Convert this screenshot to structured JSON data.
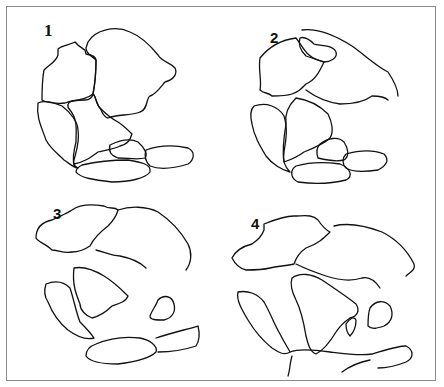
{
  "diagram": {
    "type": "continental-drift-sequence",
    "frame_color": "#8a8a8a",
    "stroke_color": "#111111",
    "panels": [
      {
        "label": "1",
        "label_pos": [
          44,
          29
        ],
        "paths": [
          "M88,42 C95,30 115,25 130,32 C140,36 150,45 158,55 C162,62 170,62 175,68 C178,74 173,80 165,82 C160,88 155,95 150,96 C146,98 148,110 140,112 C130,116 118,114 108,118 C104,118 102,112 100,108 C96,104 96,96 93,94 C95,84 96,74 96,60 C92,56 86,54 86,48 Z",
          "M58,49 C62,45 70,45 75,42 C78,46 82,48 85,50 L86,54 C92,55 96,57 96,60 C96,74 95,84 93,94 C92,98 90,100 85,100 C78,100 70,101 65,103 C55,104 45,102 42,100 C42,90 42,80 44,70 C50,64 56,62 58,55 Z",
          "M93,94 C96,96 96,104 100,108 C106,114 110,118 118,122 C124,126 128,130 132,134 C130,140 128,144 120,146 C112,150 104,150 98,152 C90,158 84,162 74,164 C72,158 74,150 76,142 C76,130 78,120 70,110 C66,106 68,102 72,101 C80,100 88,98 93,94 Z",
          "M38,103 C45,100 55,103 62,106 C70,112 78,122 78,130 C80,142 76,152 74,160 C72,164 74,166 78,168 C74,168 70,164 64,160 C58,154 50,148 46,140 C42,128 36,118 38,103 Z",
          "M110,145 C120,140 130,138 138,142 C145,148 148,155 145,158 C138,160 128,158 118,158 C112,156 108,152 110,145 Z",
          "M146,150 C160,145 175,145 188,148 C196,152 194,160 188,164 C175,168 160,170 150,166 C146,162 144,156 146,150 Z",
          "M82,165 C95,162 110,160 128,160 C140,162 152,164 150,172 C146,178 130,182 112,182 C95,180 80,178 76,172 C76,168 80,166 82,165 Z"
        ]
      },
      {
        "label": "2",
        "label_pos": [
          270,
          36
        ],
        "paths": [
          "M302,30 C318,28 336,36 352,46 C366,56 376,66 388,72 C392,78 398,88 398,96",
          "M300,38 C305,36 310,40 314,44 C318,46 332,44 336,52 C338,58 330,62 324,62 C318,60 312,58 306,56 C300,50 298,44 300,38 Z",
          "M260,58 C268,48 280,40 296,38 C304,48 306,58 324,62 C320,70 316,80 306,84 C300,90 298,92 292,94 C286,96 280,96 272,96 C268,92 264,94 260,90 C262,80 258,70 260,58 Z",
          "M306,90 C314,96 326,102 340,104 C352,104 364,102 372,96 C380,96 386,98 388,100",
          "M296,98 C310,100 320,106 328,114 C332,122 334,132 330,138 C324,144 314,148 304,152 C296,158 290,160 284,162 C282,150 284,136 286,124 C284,112 290,104 296,98 Z",
          "M254,106 C266,102 278,106 284,116 C288,128 286,140 284,152 C282,162 286,168 290,172 C282,170 272,164 266,156 C260,146 254,136 252,124 C250,116 250,110 254,106 Z",
          "M320,144 C328,138 338,136 344,142 C348,148 350,156 344,160 C336,162 326,160 318,158 C316,152 316,148 320,144 Z",
          "M346,154 C360,150 374,150 384,154 C390,160 386,166 378,170 C364,172 352,172 346,168 C342,164 342,158 346,154 Z",
          "M296,166 C310,162 326,162 340,164 C350,168 354,176 346,180 C330,184 312,184 298,182 C290,178 290,170 296,166 Z"
        ]
      },
      {
        "label": "3",
        "label_pos": [
          52,
          211
        ],
        "paths": [
          "M72,210 C80,204 92,204 104,206 C110,210 114,206 118,210 C116,218 112,222 108,226 C100,232 94,238 90,246 C84,250 78,252 72,252 C64,254 58,250 52,250 C46,244 38,242 36,238 C36,228 42,222 52,220 C60,216 66,214 72,210 Z",
          "M118,210 C130,206 146,206 158,212 C170,220 180,230 188,244 C192,252 192,262 186,270",
          "M96,250 C104,252 112,256 120,256 C130,258 140,262 146,268",
          "M74,268 C84,266 94,270 104,276 C114,282 122,290 128,296 C126,302 118,304 112,306 C106,312 100,316 92,318 C86,316 80,310 80,304 C76,294 72,284 74,268 Z",
          "M46,284 C56,280 64,282 70,288 C74,300 76,312 80,322 C86,328 90,332 94,338 C86,340 76,336 68,330 C58,322 52,312 48,302 C44,296 44,290 46,284 Z",
          "M158,300 C164,294 172,296 174,304 C176,312 172,318 164,320 C156,320 150,320 150,316 C152,310 156,306 158,300 Z",
          "M96,344 C110,338 124,336 140,338 C150,340 158,346 156,352 C150,358 134,362 118,364 C104,364 90,362 86,356 C86,350 90,346 96,344 Z",
          "M156,338 C168,334 184,330 198,326 C200,334 200,340 196,346 C184,350 170,352 158,352"
        ]
      },
      {
        "label": "4",
        "label_pos": [
          250,
          222
        ],
        "paths": [
          "M264,224 C274,220 284,216 294,216 C304,216 312,214 318,220 C322,226 326,230 330,232 C324,238 318,244 306,248 C300,252 296,258 294,264 C286,266 278,266 270,268 C262,270 254,270 246,270 C238,268 234,262 232,258 C236,250 244,246 252,244 C258,240 262,236 264,230 Z",
          "M334,226 C350,222 366,226 382,232 C398,240 408,252 414,264 C416,270 410,272 406,276",
          "M296,264 C304,268 314,272 326,276 C338,280 350,282 362,278 C370,276 376,282 380,288",
          "M292,278 C300,272 312,274 322,280 C334,288 346,296 356,304 C360,310 358,316 350,318 C344,322 340,326 336,332 C330,342 324,350 316,354 C310,352 308,344 306,336 C304,324 302,312 296,300 C292,292 290,284 292,278 Z",
          "M346,324 C350,318 354,316 356,320 C356,326 354,332 350,336 C348,334 346,330 346,324 Z",
          "M370,308 C376,300 384,300 390,306 C394,314 392,322 384,326 C378,328 372,330 368,326 C368,318 368,314 370,308 Z",
          "M238,292 C248,290 258,294 264,302 C270,312 274,324 280,334 C284,342 288,348 290,352 C284,356 278,352 272,348 C262,340 254,330 248,320 C242,310 236,300 238,292 Z",
          "M290,352 C300,348 316,350 330,352 C346,354 360,356 372,354 C386,350 398,346 406,346 C414,350 414,358 406,362 C396,366 386,368 378,368",
          "M370,360 C360,362 350,366 342,372",
          "M292,356 C290,362 290,370 288,376"
        ]
      }
    ]
  }
}
